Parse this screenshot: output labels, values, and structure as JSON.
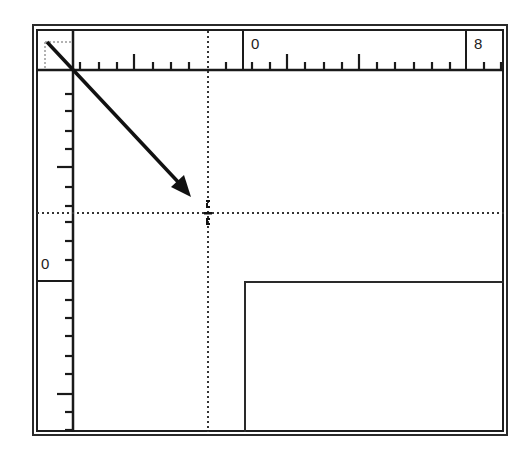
{
  "window": {
    "description": "Ruler origin drag illustration",
    "frame_color": "#1e1e1e",
    "background": "#ffffff"
  },
  "rulers": {
    "horizontal": {
      "labels": [
        {
          "text": "0",
          "x": 243
        },
        {
          "text": "8",
          "x": 466
        }
      ],
      "minor_ticks": [
        80,
        99,
        117,
        153,
        171,
        189,
        226,
        252,
        270,
        305,
        324,
        342,
        377,
        395,
        414,
        432,
        450,
        484,
        501
      ],
      "major_ticks": [
        134,
        287,
        359
      ]
    },
    "vertical": {
      "labels": [
        {
          "text": "0",
          "y": 281
        }
      ],
      "minor_ticks": [
        94,
        111,
        131,
        149,
        187,
        206,
        222,
        241,
        260,
        300,
        318,
        336,
        356,
        374,
        412,
        430
      ],
      "major_ticks": [
        167,
        394
      ]
    },
    "corner": {
      "origin_marker": "dotted-square"
    }
  },
  "guides": {
    "vertical_x": 208,
    "horizontal_y": 213,
    "style": "dotted"
  },
  "drag_arrow": {
    "from": [
      47,
      42
    ],
    "to": [
      190,
      196
    ],
    "icon": "arrow-icon"
  },
  "crosshair_cursor": {
    "x": 208,
    "y": 213,
    "icon": "crosshair-cursor-icon"
  },
  "page_rectangle": {
    "left": 245,
    "top": 282
  }
}
